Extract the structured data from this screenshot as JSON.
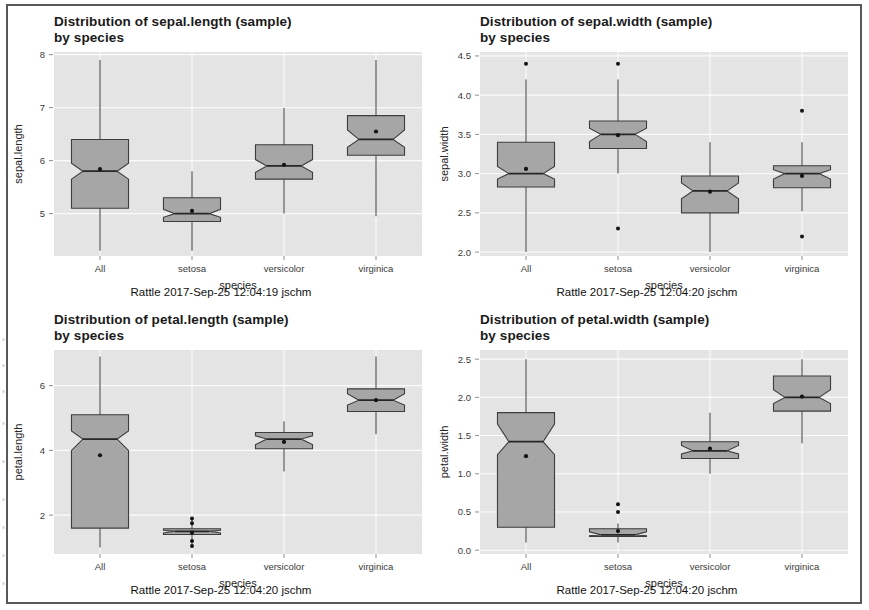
{
  "figure": {
    "source_label": "Rattle",
    "axis_x_label": "species",
    "categories": [
      "All",
      "setosa",
      "versicolor",
      "virginica"
    ]
  },
  "panels": [
    {
      "id": "sepal-length",
      "title": "Distribution of sepal.length (sample)\nby species",
      "caption": "Rattle 2017-Sep-25 12:04:19 jschm",
      "ylabel": "sepal.length",
      "xlabel": "species",
      "ylim": [
        4.2,
        8.05
      ],
      "yticks": [
        5,
        6,
        7,
        8
      ],
      "ytick_labels": [
        "5",
        "6",
        "7",
        "8"
      ]
    },
    {
      "id": "sepal-width",
      "title": "Distribution of sepal.width (sample)\nby species",
      "caption": "Rattle 2017-Sep-25 12:04:20 jschm",
      "ylabel": "sepal.width",
      "xlabel": "species",
      "ylim": [
        1.95,
        4.55
      ],
      "yticks": [
        2.0,
        2.5,
        3.0,
        3.5,
        4.0,
        4.5
      ],
      "ytick_labels": [
        "2.0",
        "2.5",
        "3.0",
        "3.5",
        "4.0",
        "4.5"
      ]
    },
    {
      "id": "petal-length",
      "title": "Distribution of petal.length (sample)\nby species",
      "caption": "Rattle 2017-Sep-25 12:04:20 jschm",
      "ylabel": "petal.length",
      "xlabel": "species",
      "ylim": [
        0.8,
        7.1
      ],
      "yticks": [
        2,
        4,
        6
      ],
      "ytick_labels": [
        "2",
        "4",
        "6"
      ]
    },
    {
      "id": "petal-width",
      "title": "Distribution of petal.width (sample)\nby species",
      "caption": "Rattle 2017-Sep-25 12:04:20 jschm",
      "ylabel": "petal.width",
      "xlabel": "species",
      "ylim": [
        -0.05,
        2.62
      ],
      "yticks": [
        0.0,
        0.5,
        1.0,
        1.5,
        2.0,
        2.5
      ],
      "ytick_labels": [
        "0.0",
        "0.5",
        "1.0",
        "1.5",
        "2.0",
        "2.5"
      ]
    }
  ],
  "chart_data": [
    {
      "type": "box",
      "id": "sepal-length",
      "title": "Distribution of sepal.length (sample) by species",
      "xlabel": "species",
      "ylabel": "sepal.length",
      "ylim": [
        4.2,
        8.05
      ],
      "yticks": [
        5,
        6,
        7,
        8
      ],
      "grid": true,
      "notched": true,
      "categories": [
        "All",
        "setosa",
        "versicolor",
        "virginica"
      ],
      "boxes": [
        {
          "category": "All",
          "min": 4.3,
          "q1": 5.1,
          "median": 5.8,
          "q3": 6.4,
          "max": 7.9,
          "mean": 5.84,
          "notch_lo": 5.65,
          "notch_hi": 5.95,
          "outliers": []
        },
        {
          "category": "setosa",
          "min": 4.3,
          "q1": 4.85,
          "median": 5.0,
          "q3": 5.3,
          "max": 5.8,
          "mean": 5.05,
          "notch_lo": 4.93,
          "notch_hi": 5.08,
          "outliers": []
        },
        {
          "category": "versicolor",
          "min": 5.0,
          "q1": 5.65,
          "median": 5.9,
          "q3": 6.3,
          "max": 7.0,
          "mean": 5.92,
          "notch_lo": 5.78,
          "notch_hi": 6.02,
          "outliers": []
        },
        {
          "category": "virginica",
          "min": 4.95,
          "q1": 6.1,
          "median": 6.4,
          "q3": 6.85,
          "max": 7.9,
          "mean": 6.55,
          "notch_lo": 6.25,
          "notch_hi": 6.58,
          "outliers": []
        }
      ]
    },
    {
      "type": "box",
      "id": "sepal-width",
      "title": "Distribution of sepal.width (sample) by species",
      "xlabel": "species",
      "ylabel": "sepal.width",
      "ylim": [
        1.95,
        4.55
      ],
      "yticks": [
        2.0,
        2.5,
        3.0,
        3.5,
        4.0,
        4.5
      ],
      "grid": true,
      "notched": true,
      "categories": [
        "All",
        "setosa",
        "versicolor",
        "virginica"
      ],
      "boxes": [
        {
          "category": "All",
          "min": 2.0,
          "q1": 2.83,
          "median": 3.0,
          "q3": 3.4,
          "max": 4.2,
          "mean": 3.06,
          "notch_lo": 2.93,
          "notch_hi": 3.09,
          "outliers": [
            4.4
          ]
        },
        {
          "category": "setosa",
          "min": 3.0,
          "q1": 3.32,
          "median": 3.5,
          "q3": 3.67,
          "max": 4.2,
          "mean": 3.49,
          "notch_lo": 3.41,
          "notch_hi": 3.58,
          "outliers": [
            4.4,
            2.3
          ]
        },
        {
          "category": "versicolor",
          "min": 2.0,
          "q1": 2.5,
          "median": 2.78,
          "q3": 2.97,
          "max": 3.4,
          "mean": 2.77,
          "notch_lo": 2.68,
          "notch_hi": 2.88,
          "outliers": []
        },
        {
          "category": "virginica",
          "min": 2.52,
          "q1": 2.82,
          "median": 3.0,
          "q3": 3.1,
          "max": 3.4,
          "mean": 2.97,
          "notch_lo": 2.93,
          "notch_hi": 3.05,
          "outliers": [
            3.8,
            2.2
          ]
        }
      ]
    },
    {
      "type": "box",
      "id": "petal-length",
      "title": "Distribution of petal.length (sample) by species",
      "xlabel": "species",
      "ylabel": "petal.length",
      "ylim": [
        0.8,
        7.1
      ],
      "yticks": [
        2,
        4,
        6
      ],
      "grid": true,
      "notched": true,
      "categories": [
        "All",
        "setosa",
        "versicolor",
        "virginica"
      ],
      "boxes": [
        {
          "category": "All",
          "min": 1.0,
          "q1": 1.6,
          "median": 4.35,
          "q3": 5.1,
          "max": 6.9,
          "mean": 3.85,
          "notch_lo": 4.0,
          "notch_hi": 4.6,
          "outliers": []
        },
        {
          "category": "setosa",
          "min": 1.0,
          "q1": 1.4,
          "median": 1.5,
          "q3": 1.58,
          "max": 1.9,
          "mean": 1.46,
          "notch_lo": 1.45,
          "notch_hi": 1.53,
          "outliers": [
            1.9,
            1.75,
            1.2,
            1.05
          ]
        },
        {
          "category": "versicolor",
          "min": 3.35,
          "q1": 4.05,
          "median": 4.35,
          "q3": 4.55,
          "max": 4.9,
          "mean": 4.26,
          "notch_lo": 4.18,
          "notch_hi": 4.45,
          "outliers": []
        },
        {
          "category": "virginica",
          "min": 4.5,
          "q1": 5.2,
          "median": 5.55,
          "q3": 5.9,
          "max": 6.9,
          "mean": 5.55,
          "notch_lo": 5.4,
          "notch_hi": 5.75,
          "outliers": []
        }
      ]
    },
    {
      "type": "box",
      "id": "petal-width",
      "title": "Distribution of petal.width (sample) by species",
      "xlabel": "species",
      "ylabel": "petal.width",
      "ylim": [
        -0.05,
        2.62
      ],
      "yticks": [
        0.0,
        0.5,
        1.0,
        1.5,
        2.0,
        2.5
      ],
      "grid": true,
      "notched": true,
      "categories": [
        "All",
        "setosa",
        "versicolor",
        "virginica"
      ],
      "boxes": [
        {
          "category": "All",
          "min": 0.1,
          "q1": 0.3,
          "median": 1.42,
          "q3": 1.8,
          "max": 2.5,
          "mean": 1.23,
          "notch_lo": 1.25,
          "notch_hi": 1.65,
          "outliers": []
        },
        {
          "category": "setosa",
          "min": 0.1,
          "q1": 0.18,
          "median": 0.2,
          "q3": 0.28,
          "max": 0.35,
          "mean": 0.25,
          "notch_lo": 0.19,
          "notch_hi": 0.24,
          "outliers": [
            0.6,
            0.5
          ]
        },
        {
          "category": "versicolor",
          "min": 1.0,
          "q1": 1.2,
          "median": 1.3,
          "q3": 1.42,
          "max": 1.8,
          "mean": 1.33,
          "notch_lo": 1.26,
          "notch_hi": 1.37,
          "outliers": []
        },
        {
          "category": "virginica",
          "min": 1.4,
          "q1": 1.82,
          "median": 2.0,
          "q3": 2.28,
          "max": 2.5,
          "mean": 2.01,
          "notch_lo": 1.92,
          "notch_hi": 2.1,
          "outliers": []
        }
      ]
    }
  ]
}
